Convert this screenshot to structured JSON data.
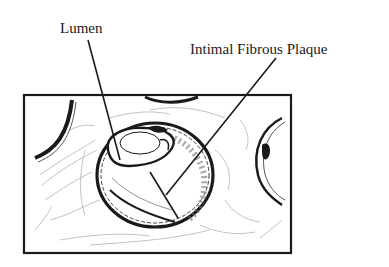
{
  "figure": {
    "type": "anatomical-line-drawing",
    "labels": [
      {
        "id": "lumen",
        "text": "Lumen",
        "points_to": "vessel lumen"
      },
      {
        "id": "plaque",
        "text": "Intimal Fibrous Plaque",
        "points_to": "thickened intima within vessel wall"
      }
    ]
  },
  "colors": {
    "ink": "#1a1a1a",
    "light_ink": "#8a8a8a",
    "background": "#ffffff"
  }
}
